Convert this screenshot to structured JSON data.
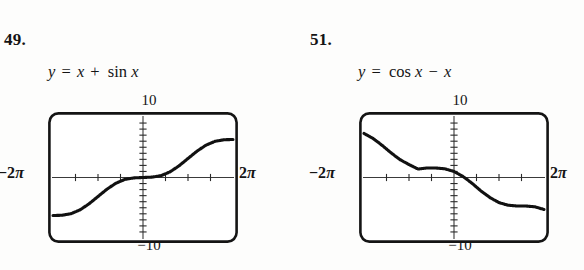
{
  "page": {
    "background": "#fdfdfc",
    "ink": "#141414"
  },
  "problems": [
    {
      "number": "49.",
      "equation": {
        "lhs": "y",
        "equals": "=",
        "term1": "x",
        "operator": "+",
        "function": "sin",
        "argument": "x",
        "full_text": "y = x + sin x"
      },
      "window": {
        "top_label": "10",
        "bottom_label": "−10",
        "left_label_coefficient": "−2",
        "left_label_symbol": "π",
        "right_label_coefficient": "2",
        "right_label_symbol": "π",
        "left_label_full": "−2π",
        "right_label_full": "2π"
      }
    },
    {
      "number": "51.",
      "equation": {
        "lhs": "y",
        "equals": "=",
        "function": "cos",
        "argument": "x",
        "operator": "−",
        "term1": "x",
        "full_text": "y = cos x − x"
      },
      "window": {
        "top_label": "10",
        "bottom_label": "−10",
        "left_label_coefficient": "−2",
        "left_label_symbol": "π",
        "right_label_coefficient": "2",
        "right_label_symbol": "π",
        "left_label_full": "−2π",
        "right_label_full": "2π"
      }
    }
  ],
  "chart_data": [
    {
      "type": "line",
      "title": "y = x + sin x",
      "xlabel": "x",
      "ylabel": "y",
      "xlim": [
        -6.283185,
        6.283185
      ],
      "ylim": [
        -10,
        10
      ],
      "xtick_labels": [
        "−2π",
        "2π"
      ],
      "ytick_labels": [
        "10",
        "−10"
      ],
      "x_tick_count": 8,
      "y_tick_count": 20,
      "grid": false,
      "legend": "none",
      "series": [
        {
          "name": "x + sin x",
          "x": [
            -6.283185,
            -5.654867,
            -5.026548,
            -4.39823,
            -3.769911,
            -3.141593,
            -2.513274,
            -1.884956,
            -1.256637,
            -0.628319,
            0,
            0.628319,
            1.256637,
            1.884956,
            2.513274,
            3.141593,
            3.769911,
            4.39823,
            5.026548,
            5.654867,
            6.283185
          ],
          "y": [
            -6.283185,
            -6.242,
            -5.978,
            -5.349,
            -4.357,
            -3.141593,
            -1.926,
            -0.9335,
            -0.3045,
            -0.0632,
            0,
            0.0632,
            0.3045,
            0.9335,
            1.926,
            3.141593,
            4.357,
            5.349,
            5.978,
            6.242,
            6.283185
          ]
        }
      ]
    },
    {
      "type": "line",
      "title": "y = cos x − x",
      "xlabel": "x",
      "ylabel": "y",
      "xlim": [
        -6.283185,
        6.283185
      ],
      "ylim": [
        -10,
        10
      ],
      "xtick_labels": [
        "−2π",
        "2π"
      ],
      "ytick_labels": [
        "10",
        "−10"
      ],
      "x_tick_count": 8,
      "y_tick_count": 20,
      "grid": false,
      "legend": "none",
      "series": [
        {
          "name": "cos x − x",
          "x": [
            -6.283185,
            -5.654867,
            -5.026548,
            -4.39823,
            -3.769911,
            -3.141593,
            -2.513274,
            -1.884956,
            -1.256637,
            -0.628319,
            0,
            0.628319,
            1.256637,
            1.884956,
            2.513274,
            3.141593,
            3.769911,
            4.39823,
            5.026548,
            5.654867,
            6.283185
          ],
          "y": [
            7.283185,
            6.464,
            5.336,
            4.089,
            2.96,
            2.141593,
            1.404,
            1.576,
            1.566,
            1.437,
            1.0,
            0.1725,
            -0.9459,
            -2.2326,
            -3.3222,
            -4.141593,
            -4.578,
            -4.707,
            -4.717,
            -4.845,
            -5.283185
          ]
        }
      ]
    }
  ]
}
